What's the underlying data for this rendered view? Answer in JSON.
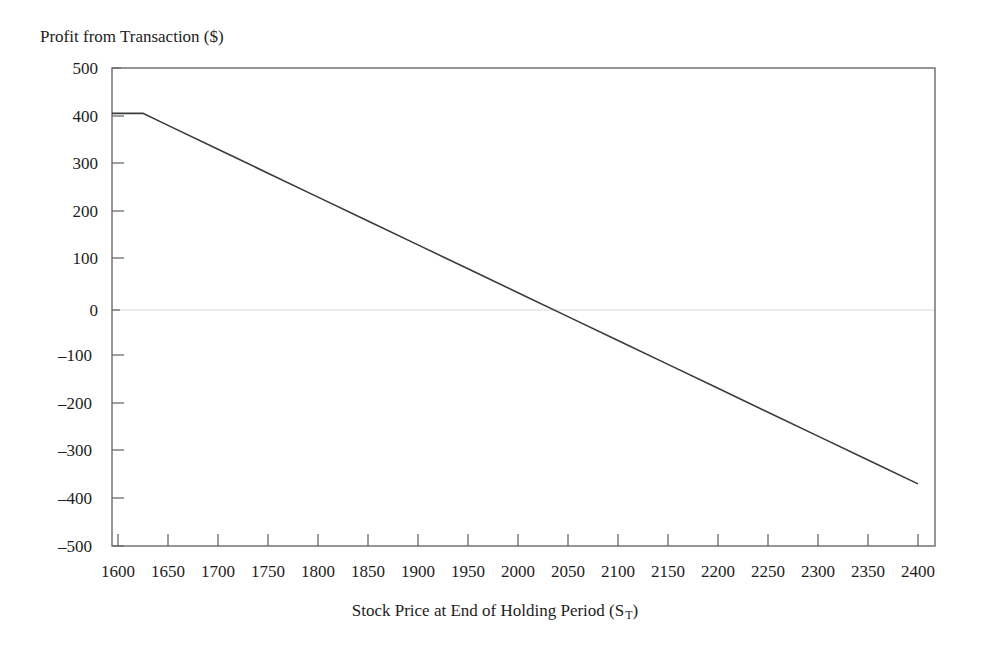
{
  "chart_data": {
    "type": "line",
    "title": "",
    "ylabel": "Profit from Transaction ($)",
    "xlabel_prefix": "Stock Price at End of Holding Period (S",
    "xlabel_subscript": "T",
    "xlabel_suffix": ")",
    "xlabel_full": "Stock Price at End of Holding Period (S_T)",
    "xlim": [
      1600,
      2400
    ],
    "ylim": [
      -500,
      500
    ],
    "grid": "zero-line-only",
    "legend": "none",
    "line_color": "#3a3a3a",
    "axis_color": "#5a5a5a",
    "zero_gridline_color": "#e2e2e2",
    "xticks": [
      "1600",
      "1650",
      "1700",
      "1750",
      "1800",
      "1850",
      "1900",
      "1950",
      "2000",
      "2050",
      "2100",
      "2150",
      "2200",
      "2250",
      "2300",
      "2350",
      "2400"
    ],
    "xtick_values": [
      1600,
      1650,
      1700,
      1750,
      1800,
      1850,
      1900,
      1950,
      2000,
      2050,
      2100,
      2150,
      2200,
      2250,
      2300,
      2350,
      2400
    ],
    "yticks": [
      "500",
      "400",
      "300",
      "200",
      "100",
      "0",
      "–100",
      "–200",
      "–300",
      "–400",
      "–500"
    ],
    "ytick_values": [
      500,
      400,
      300,
      200,
      100,
      0,
      -100,
      -200,
      -300,
      -400,
      -500
    ],
    "series": [
      {
        "name": "Profit from Transaction",
        "x": [
          1600,
          1625,
          1650,
          1700,
          1750,
          1800,
          1850,
          1900,
          1950,
          2000,
          2050,
          2100,
          2150,
          2200,
          2250,
          2300,
          2350,
          2400
        ],
        "values": [
          405,
          405,
          380,
          330,
          280,
          230,
          180,
          130,
          80,
          30,
          -20,
          -70,
          -120,
          -170,
          -220,
          -270,
          -320,
          -370
        ]
      }
    ],
    "annotations": []
  }
}
